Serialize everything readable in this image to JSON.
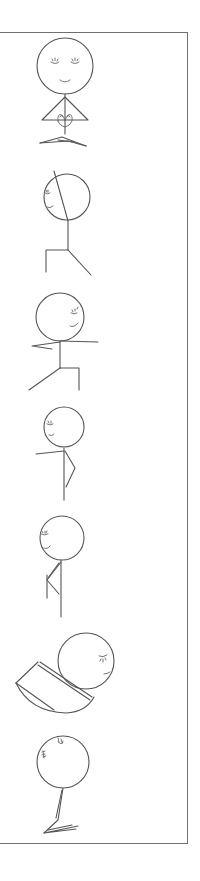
{
  "illustration": {
    "title": "Yoga stick figure poses",
    "stroke_color": "#555555",
    "frame_color": "#6f6f6f",
    "background": "#ffffff",
    "poses": [
      {
        "index": 1,
        "name": "Seated meditation (prayer hands, crossed legs)",
        "expression": "eyes closed, smiling"
      },
      {
        "index": 2,
        "name": "Standing pose, arm raised alongside head, one knee bent",
        "expression": "eyes closed, smiling"
      },
      {
        "index": 3,
        "name": "Warrior II",
        "expression": "eyes closed, smiling"
      },
      {
        "index": 4,
        "name": "Standing with bent knee, arm extended forward",
        "expression": "eyes closed, smiling"
      },
      {
        "index": 5,
        "name": "Standing with leg folded behind",
        "expression": "eyes closed, smiling"
      },
      {
        "index": 6,
        "name": "Forward fold / rounded back pose",
        "expression": "eyes closed, smiling"
      },
      {
        "index": 7,
        "name": "Seated with legs extended, head tilted",
        "expression": "eyes closed"
      }
    ]
  }
}
